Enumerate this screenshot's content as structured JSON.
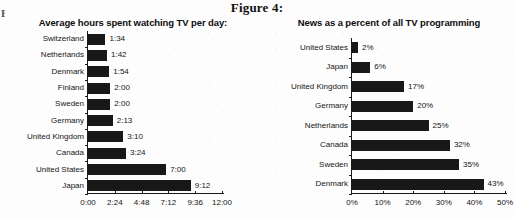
{
  "figure": {
    "title": "Figure 4:",
    "edge_artifact": "E"
  },
  "chart_data": [
    {
      "id": "tv-hours",
      "type": "bar",
      "orientation": "horizontal",
      "title": "Average hours spent watching TV per day:",
      "xlabel": "",
      "ylabel": "",
      "grid": false,
      "legend": "none",
      "xlim": [
        0,
        12
      ],
      "xunit": "hours:minutes",
      "xticks": [
        0,
        2.4,
        4.8,
        7.2,
        9.6,
        12
      ],
      "xtick_labels": [
        "0:00",
        "2:24",
        "4:48",
        "7:12",
        "9:36",
        "12:00"
      ],
      "categories": [
        "Switzerland",
        "Netherlands",
        "Denmark",
        "Finland",
        "Sweden",
        "Germany",
        "United Kingdom",
        "Canada",
        "United States",
        "Japan"
      ],
      "values": [
        1.5667,
        1.7,
        1.9,
        2.0,
        2.0,
        2.2167,
        3.1667,
        3.4,
        7.0,
        9.2
      ],
      "data_labels": [
        "1:34",
        "1:42",
        "1:54",
        "2:00",
        "2:00",
        "2:13",
        "3:10",
        "3:24",
        "7:00",
        "9:12"
      ]
    },
    {
      "id": "news-percent",
      "type": "bar",
      "orientation": "horizontal",
      "title": "News as a percent of all TV programming",
      "xlabel": "",
      "ylabel": "",
      "grid": false,
      "legend": "none",
      "xlim": [
        0,
        50
      ],
      "xunit": "percent",
      "xticks": [
        0,
        10,
        20,
        30,
        40,
        50
      ],
      "xtick_labels": [
        "0%",
        "10%",
        "20%",
        "30%",
        "40%",
        "50%"
      ],
      "categories": [
        "United States",
        "Japan",
        "United Kingdom",
        "Germany",
        "Netherlands",
        "Canada",
        "Sweden",
        "Denmark"
      ],
      "values": [
        2,
        6,
        17,
        20,
        25,
        32,
        35,
        43
      ],
      "data_labels": [
        "2%",
        "6%",
        "17%",
        "20%",
        "25%",
        "32%",
        "35%",
        "43%"
      ]
    }
  ],
  "colors": {
    "bar": "#181818",
    "axis": "#1a1a1a",
    "text": "#151515",
    "background": "#fdfdfd"
  }
}
